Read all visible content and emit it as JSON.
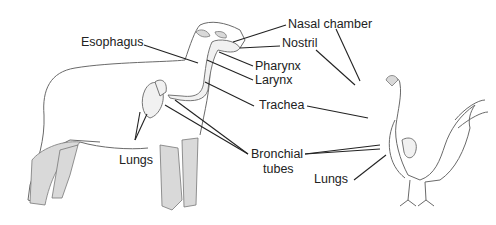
{
  "diagram": {
    "subjects": [
      "sheep",
      "chicken"
    ],
    "labels": {
      "esophagus": "Esophagus",
      "nasal_chamber": "Nasal chamber",
      "nostril": "Nostril",
      "pharynx": "Pharynx",
      "larynx": "Larynx",
      "trachea": "Trachea",
      "lungs_sheep": "Lungs",
      "bronchial_line1": "Bronchial",
      "bronchial_line2": "tubes",
      "lungs_chicken": "Lungs"
    }
  }
}
